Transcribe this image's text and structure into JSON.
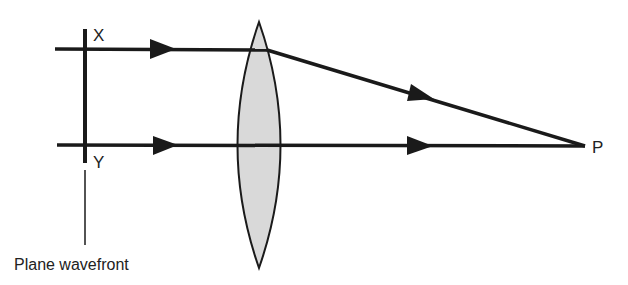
{
  "diagram": {
    "labels": {
      "x": "X",
      "y": "Y",
      "p": "P",
      "wavefront": "Plane wavefront"
    },
    "colors": {
      "line": "#1a1a1a",
      "lens_fill": "#d9d9d9",
      "text": "#222222"
    }
  }
}
